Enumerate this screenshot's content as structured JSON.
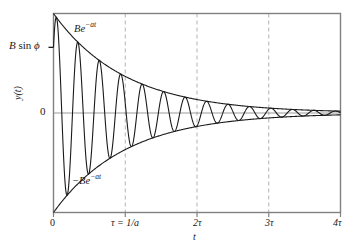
{
  "figure": {
    "kind": "damped-oscillation-plot",
    "background": "#ffffff",
    "curve_color": "#1a1a1a",
    "envelope_color": "#1a1a1a",
    "frame_color": "#808080",
    "gridline_color": "#b3b3b3",
    "zero_line_color": "#808080"
  },
  "labels": {
    "envelope_positive": "Be",
    "envelope_positive_exp": "−at",
    "envelope_negative": "−Be",
    "envelope_negative_exp": "−at",
    "amplitude_prefix": "B",
    "amplitude_fn": "sin",
    "amplitude_phase": "ϕ",
    "y_zero": "0",
    "y_axis": "y(t)",
    "x_axis": "t"
  },
  "axes": {
    "x_ticks": [
      {
        "label": "0",
        "value": 0
      },
      {
        "label": "τ = 1/a",
        "value": 1
      },
      {
        "label": "2τ",
        "value": 2
      },
      {
        "label": "3τ",
        "value": 3
      },
      {
        "label": "4τ",
        "value": 4
      }
    ],
    "xlim": [
      0,
      4
    ],
    "ylim": [
      -1,
      1
    ],
    "gridlines_x": [
      1,
      2,
      3
    ],
    "zero_line": 0
  },
  "chart_data": {
    "type": "line",
    "title": "",
    "xlabel": "t",
    "ylabel": "y(t)",
    "xlim": [
      0,
      4
    ],
    "ylim": [
      -1.0,
      1.0
    ],
    "x_tick_labels": [
      "0",
      "τ = 1/a",
      "2τ",
      "3τ",
      "4τ"
    ],
    "x_tick_values": [
      0,
      1,
      2,
      3,
      4
    ],
    "y_tick_labels": [
      "0"
    ],
    "y_tick_values": [
      0
    ],
    "grid": "vertical-dashed-at-tau-2tau-3tau",
    "legend": "none",
    "annotations": [
      {
        "text": "Be^-at",
        "role": "upper-envelope-label",
        "x": 0.55,
        "y": 0.82
      },
      {
        "text": "-Be^-at",
        "role": "lower-envelope-label",
        "x": 0.45,
        "y": -0.62
      },
      {
        "text": "B sin ϕ",
        "role": "y-axis-tick-annotation",
        "x": 0,
        "y": 0.66
      }
    ],
    "series": [
      {
        "name": "y(t) = B e^{-at} sin(ωt + ϕ)",
        "formula": "B*exp(-a*t)*sin(omega*t + phi)",
        "params": {
          "B": 1.0,
          "a": 1.0,
          "omega": 21.0,
          "phi": 0.72
        },
        "note": "damped sinusoid, amplitude decays as exp(-t/tau), tau = 1/a"
      },
      {
        "name": "upper envelope",
        "formula": "exp(-t)",
        "x": [
          0,
          0.5,
          1,
          1.5,
          2,
          2.5,
          3,
          3.5,
          4
        ],
        "values": [
          1.0,
          0.607,
          0.368,
          0.223,
          0.135,
          0.082,
          0.05,
          0.03,
          0.018
        ]
      },
      {
        "name": "lower envelope",
        "formula": "-exp(-t)",
        "x": [
          0,
          0.5,
          1,
          1.5,
          2,
          2.5,
          3,
          3.5,
          4
        ],
        "values": [
          -1.0,
          -0.607,
          -0.368,
          -0.223,
          -0.135,
          -0.082,
          -0.05,
          -0.03,
          -0.018
        ]
      }
    ]
  }
}
